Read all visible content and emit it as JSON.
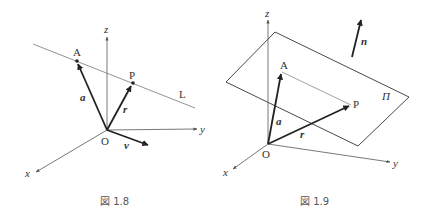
{
  "figures": [
    {
      "caption": "図 1.8",
      "labels": {
        "z": "z",
        "y": "y",
        "x": "x",
        "O": "O",
        "A": "A",
        "P": "P",
        "L": "L",
        "a": "a",
        "r": "r",
        "v": "v"
      }
    },
    {
      "caption": "図 1.9",
      "labels": {
        "z": "z",
        "y": "y",
        "x": "x",
        "O": "O",
        "A": "A",
        "P": "P",
        "Pi": "Π",
        "n": "n",
        "a": "a",
        "r": "r"
      }
    }
  ],
  "colors": {
    "axis": "#555555",
    "vector": "#222222",
    "line": "#777777"
  }
}
